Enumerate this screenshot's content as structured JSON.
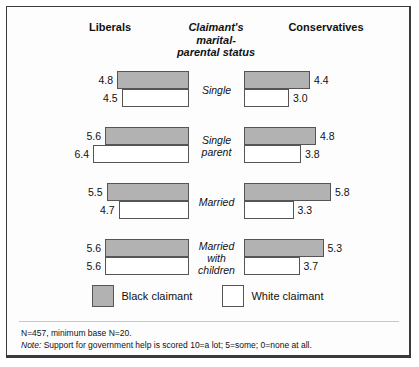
{
  "headers": {
    "left": "Liberals",
    "center": "Claimant's marital-parental status",
    "right": "Conservatives"
  },
  "legend": {
    "black": "Black claimant",
    "white": "White claimant"
  },
  "notes": {
    "base": "N=457, minimum base N=20.",
    "note_prefix": "Note:",
    "note_text": " Support for government help is scored 10=a lot; 5=some; 0=none at all."
  },
  "colors": {
    "black_claimant": "#b2b2b2",
    "white_claimant": "#ffffff",
    "outline": "#555555"
  },
  "chart_data": {
    "type": "bar",
    "xlabel": "",
    "ylabel": "Claimant's marital-parental status",
    "categories": [
      "Single",
      "Single parent",
      "Married",
      "Married with children"
    ],
    "groups": [
      "Liberals",
      "Conservatives"
    ],
    "series": [
      {
        "name": "Black claimant",
        "group": "Liberals",
        "values": [
          4.8,
          5.6,
          5.5,
          5.6
        ]
      },
      {
        "name": "White claimant",
        "group": "Liberals",
        "values": [
          4.5,
          6.4,
          4.7,
          5.6
        ]
      },
      {
        "name": "Black claimant",
        "group": "Conservatives",
        "values": [
          4.4,
          4.8,
          5.8,
          5.3
        ]
      },
      {
        "name": "White claimant",
        "group": "Conservatives",
        "values": [
          3.0,
          3.8,
          3.3,
          3.7
        ]
      }
    ],
    "xlim": [
      0,
      10
    ],
    "grid": false,
    "legend_position": "bottom",
    "orientation": "horizontal-mirrored",
    "scale_px_per_unit": 15,
    "rows": [
      {
        "category": "Single",
        "left": {
          "black": 4.8,
          "white": 4.5
        },
        "right": {
          "black": 4.4,
          "white": 3.0
        }
      },
      {
        "category": "Single parent",
        "left": {
          "black": 5.6,
          "white": 6.4
        },
        "right": {
          "black": 4.8,
          "white": 3.8
        }
      },
      {
        "category": "Married",
        "left": {
          "black": 5.5,
          "white": 4.7
        },
        "right": {
          "black": 5.8,
          "white": 3.3
        }
      },
      {
        "category": "Married with children",
        "left": {
          "black": 5.6,
          "white": 5.6
        },
        "right": {
          "black": 5.3,
          "white": 3.7
        }
      }
    ]
  }
}
